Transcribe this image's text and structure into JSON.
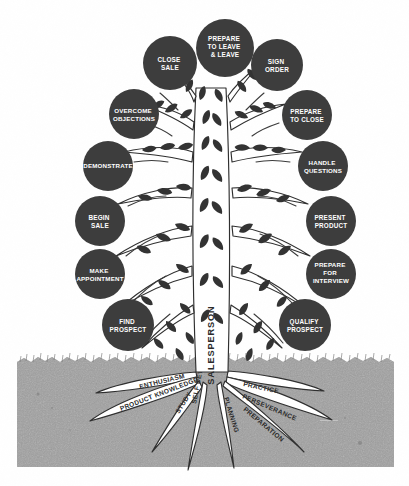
{
  "diagram": {
    "trunk_label": "SALESPERSON",
    "colors": {
      "node_fill": "#3d3d3d",
      "node_text": "#ffffff",
      "soil": "#a8a8a8",
      "background": "#ffffff",
      "root_fill": "#ffffff",
      "outline": "#2f2f2f"
    }
  },
  "canopy": {
    "left_nodes": [
      {
        "id": "close-sale",
        "label_lines": [
          "CLOSE",
          "SALE"
        ],
        "cx": 170,
        "cy": 63,
        "r": 27
      },
      {
        "id": "overcome-objections",
        "label_lines": [
          "OVERCOME",
          "OBJECTIONS"
        ],
        "cx": 134,
        "cy": 114,
        "r": 25
      },
      {
        "id": "demonstrate",
        "label_lines": [
          "DEMONSTRATE"
        ],
        "cx": 108,
        "cy": 166,
        "r": 25
      },
      {
        "id": "begin-sale",
        "label_lines": [
          "BEGIN",
          "SALE"
        ],
        "cx": 100,
        "cy": 221,
        "r": 25
      },
      {
        "id": "make-appointment",
        "label_lines": [
          "MAKE",
          "APPOINTMENT"
        ],
        "cx": 100,
        "cy": 274,
        "r": 25
      },
      {
        "id": "find-prospect",
        "label_lines": [
          "FIND",
          "PROSPECT"
        ],
        "cx": 128,
        "cy": 325,
        "r": 26
      }
    ],
    "top_node": {
      "id": "prepare-to-leave",
      "label_lines": [
        "PREPARE",
        "TO LEAVE",
        "& LEAVE"
      ],
      "cx": 225,
      "cy": 48,
      "r": 29
    },
    "right_nodes": [
      {
        "id": "sign-order",
        "label_lines": [
          "SIGN",
          "ORDER"
        ],
        "cx": 277,
        "cy": 65,
        "r": 26
      },
      {
        "id": "prepare-to-close",
        "label_lines": [
          "PREPARE",
          "TO CLOSE"
        ],
        "cx": 307,
        "cy": 115,
        "r": 25
      },
      {
        "id": "handle-questions",
        "label_lines": [
          "HANDLE",
          "QUESTIONS"
        ],
        "cx": 323,
        "cy": 166,
        "r": 25
      },
      {
        "id": "present-product",
        "label_lines": [
          "PRESENT",
          "PRODUCT"
        ],
        "cx": 331,
        "cy": 221,
        "r": 25
      },
      {
        "id": "prepare-for-interview",
        "label_lines": [
          "PREPARE",
          "FOR",
          "INTERVIEW"
        ],
        "cx": 331,
        "cy": 274,
        "r": 25
      },
      {
        "id": "qualify-prospect",
        "label_lines": [
          "QUALIFY",
          "PROSPECT"
        ],
        "cx": 305,
        "cy": 325,
        "r": 26
      }
    ]
  },
  "roots": {
    "left": [
      {
        "id": "enthusiasm",
        "label": "ENTHUSIASM",
        "angle": -14,
        "x": 140,
        "y": 389
      },
      {
        "id": "product-knowledge",
        "label": "PRODUCT KNOWLEDGE",
        "angle": -20,
        "x": 123,
        "y": 411
      },
      {
        "id": "study",
        "label": "STUDY",
        "angle": -58,
        "x": 178,
        "y": 414
      },
      {
        "id": "self-development",
        "label": "SELF DEVELOPMENT",
        "angle": -75,
        "x": 194,
        "y": 415
      }
    ],
    "right": [
      {
        "id": "practice",
        "label": "PRACTICE",
        "angle": 12,
        "x": 243,
        "y": 386
      },
      {
        "id": "perseverance",
        "label": "PERSEVERANCE",
        "angle": 22,
        "x": 242,
        "y": 398
      },
      {
        "id": "preparation",
        "label": "PREPARATION",
        "angle": 39,
        "x": 243,
        "y": 410
      },
      {
        "id": "planning",
        "label": "PLANNING",
        "angle": 72,
        "x": 229,
        "y": 404
      }
    ]
  },
  "ground": {
    "label": "soil",
    "top_y": 357,
    "bottom_y": 467,
    "left_x": 17,
    "right_x": 394
  }
}
